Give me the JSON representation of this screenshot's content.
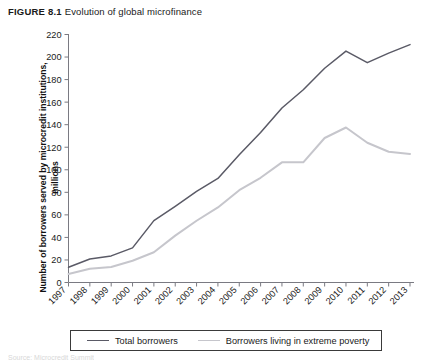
{
  "figure": {
    "label": "FIGURE 8.1",
    "title": "Evolution of global microfinance"
  },
  "source_note": "Source: Microcredit Summit",
  "axis": {
    "x_title": "Year",
    "y_title_line1": "Number of borrowers served by microcredit",
    "y_title_line2": "institutions, millions"
  },
  "legend": {
    "position": "bottom",
    "entries": [
      {
        "label": "Total borrowers",
        "color": "#5a5a66"
      },
      {
        "label": "Borrowers living in extreme poverty",
        "color": "#c6c6cc"
      }
    ]
  },
  "chart_data": {
    "type": "line",
    "title": "Evolution of global microfinance",
    "xlabel": "Year",
    "ylabel": "Number of borrowers served by microcredit institutions, millions",
    "x": [
      "1997",
      "1998",
      "1999",
      "2000",
      "2001",
      "2002",
      "2003",
      "2004",
      "2005",
      "2006",
      "2007",
      "2008",
      "2009",
      "2010",
      "2011",
      "2012",
      "2013"
    ],
    "categories": [
      "1997",
      "1998",
      "1999",
      "2000",
      "2001",
      "2002",
      "2003",
      "2004",
      "2005",
      "2006",
      "2007",
      "2008",
      "2009",
      "2010",
      "2011",
      "2012",
      "2013"
    ],
    "series": [
      {
        "name": "Total borrowers",
        "color": "#5a5a66",
        "values": [
          13.5,
          20.9,
          23.6,
          30.7,
          54.9,
          67.6,
          80.9,
          92.3,
          113.3,
          133.0,
          154.8,
          171.0,
          190.1,
          205.3,
          195.0,
          203.5,
          211.0
        ]
      },
      {
        "name": "Borrowers living in extreme poverty",
        "color": "#c6c6cc",
        "values": [
          7.6,
          12.2,
          13.8,
          19.3,
          26.8,
          41.6,
          54.8,
          66.6,
          81.9,
          92.9,
          106.6,
          106.6,
          128.2,
          137.5,
          124.0,
          116.0,
          114.0
        ]
      }
    ],
    "ylim": [
      0,
      220
    ],
    "ytick_step": 20,
    "yticks": [
      0,
      20,
      40,
      60,
      80,
      100,
      120,
      140,
      160,
      180,
      200,
      220
    ],
    "grid": false,
    "legend_position": "bottom"
  }
}
